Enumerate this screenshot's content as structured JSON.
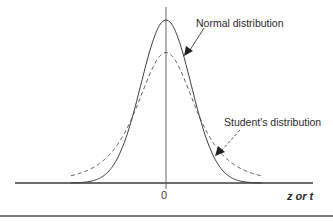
{
  "chart_data": {
    "type": "line",
    "title": "",
    "xlabel": "z or t",
    "ylabel": "",
    "x_ticks": [
      "0"
    ],
    "xlim": [
      -4,
      4
    ],
    "grid": false,
    "legend": "annotations",
    "series": [
      {
        "name": "Normal distribution",
        "style": "solid",
        "description": "Standard normal density, taller peak at 0 (~0.40)",
        "peak": 0.4,
        "x": [
          -4,
          -3,
          -2,
          -1,
          0,
          1,
          2,
          3,
          4
        ],
        "values": [
          0.0001,
          0.0044,
          0.054,
          0.242,
          0.399,
          0.242,
          0.054,
          0.0044,
          0.0001
        ]
      },
      {
        "name": "Student's distribution",
        "style": "dashed",
        "description": "Student's t density, lower peak (~0.32) and heavier tails",
        "peak": 0.32,
        "x": [
          -4,
          -3,
          -2,
          -1,
          0,
          1,
          2,
          3,
          4
        ],
        "values": [
          0.007,
          0.02,
          0.068,
          0.2,
          0.32,
          0.2,
          0.068,
          0.02,
          0.007
        ]
      }
    ],
    "annotations": [
      {
        "text": "Normal distribution",
        "points_to": "Normal distribution curve (right flank)"
      },
      {
        "text": "Student's distribution",
        "points_to": "Student's distribution curve (right tail)"
      }
    ]
  },
  "labels": {
    "normal": "Normal distribution",
    "student": "Student's distribution",
    "zero_tick": "0",
    "x_axis": "z or t"
  },
  "colors": {
    "curve": "#3a3a3a",
    "axis": "#3a3a3a",
    "rule": "#7a7a7a"
  }
}
